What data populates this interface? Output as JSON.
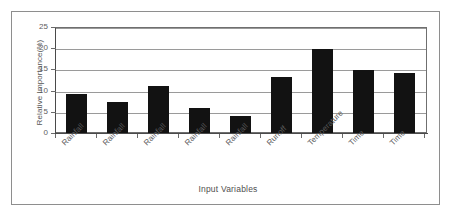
{
  "chart_data": {
    "type": "bar",
    "title": "",
    "xlabel": "Input Variables",
    "ylabel": "Relative Importance(%)",
    "categories": [
      "Rainfall",
      "Rainfall",
      "Rainfall",
      "Rainfall",
      "Rainfall",
      "Runoff",
      "Temperature",
      "Time",
      "Time"
    ],
    "values": [
      9.2,
      7.2,
      11.0,
      5.8,
      4.0,
      13.2,
      19.7,
      14.9,
      14.2
    ],
    "ylim": [
      0,
      25
    ],
    "yticks": [
      0,
      5,
      10,
      15,
      20,
      25
    ],
    "ytick_labels": [
      "0",
      "5",
      "10",
      "15",
      "20",
      "25"
    ],
    "grid": true,
    "legend": false,
    "bar_color": "#121212",
    "gridline_color": "#9a9a9a",
    "axis_color": "#4a4a4a",
    "text_color": "#555555"
  }
}
